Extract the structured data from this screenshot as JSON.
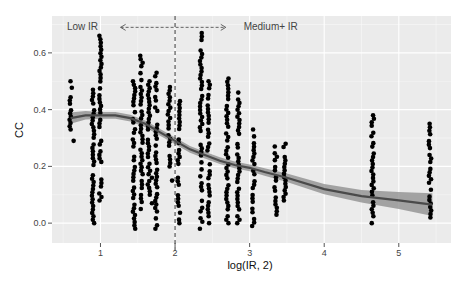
{
  "chart_data": {
    "type": "scatter",
    "title": "",
    "xlabel": "log(IR, 2)",
    "ylabel": "CC",
    "xlim": [
      0.35,
      5.7
    ],
    "ylim": [
      -0.07,
      0.73
    ],
    "x_ticks": [
      1,
      2,
      3,
      4,
      5
    ],
    "x_tick_labels": [
      "1",
      "2",
      "3",
      "4",
      "5"
    ],
    "y_ticks": [
      0.0,
      0.2,
      0.4,
      0.6
    ],
    "y_tick_labels": [
      "0.0",
      "0.2",
      "0.4",
      "0.6"
    ],
    "grid": true,
    "legend": "none",
    "vline": {
      "x": 2.0,
      "style": "dashed"
    },
    "annotations": [
      {
        "text": "Low IR",
        "x": 0.55,
        "y": 0.69
      },
      {
        "text": "<-----------|----------->",
        "x": 1.65,
        "y": 0.69
      },
      {
        "text": "Medium+ IR",
        "x": 3.6,
        "y": 0.69
      }
    ],
    "point_columns": [
      {
        "x": 0.6,
        "ymin": 0.33,
        "ymax": 0.5,
        "extra": [
          0.29
        ]
      },
      {
        "x": 0.9,
        "ymin": 0.0,
        "ymax": 0.47,
        "extra": []
      },
      {
        "x": 1.0,
        "ymin": 0.08,
        "ymax": 0.66,
        "extra": []
      },
      {
        "x": 1.45,
        "ymin": -0.02,
        "ymax": 0.5,
        "extra": []
      },
      {
        "x": 1.55,
        "ymin": 0.05,
        "ymax": 0.59,
        "extra": []
      },
      {
        "x": 1.65,
        "ymin": 0.1,
        "ymax": 0.5,
        "extra": [
          0.07,
          0.16
        ]
      },
      {
        "x": 1.75,
        "ymin": -0.02,
        "ymax": 0.53,
        "extra": []
      },
      {
        "x": 1.92,
        "ymin": 0.2,
        "ymax": 0.48,
        "extra": [
          0.15
        ]
      },
      {
        "x": 2.05,
        "ymin": 0.0,
        "ymax": 0.43,
        "extra": []
      },
      {
        "x": 2.35,
        "ymin": -0.02,
        "ymax": 0.67,
        "extra": []
      },
      {
        "x": 2.45,
        "ymin": 0.0,
        "ymax": 0.5,
        "extra": []
      },
      {
        "x": 2.7,
        "ymin": 0.0,
        "ymax": 0.51,
        "extra": []
      },
      {
        "x": 2.85,
        "ymin": 0.0,
        "ymax": 0.46,
        "extra": []
      },
      {
        "x": 3.05,
        "ymin": -0.01,
        "ymax": 0.33,
        "extra": []
      },
      {
        "x": 3.35,
        "ymin": 0.03,
        "ymax": 0.27,
        "extra": []
      },
      {
        "x": 3.47,
        "ymin": 0.08,
        "ymax": 0.28,
        "extra": []
      },
      {
        "x": 4.65,
        "ymin": 0.0,
        "ymax": 0.38,
        "extra": []
      },
      {
        "x": 5.42,
        "ymin": 0.02,
        "ymax": 0.35,
        "extra": []
      }
    ],
    "smooth": {
      "type": "loess",
      "x": [
        0.6,
        0.8,
        1.0,
        1.2,
        1.4,
        1.6,
        1.8,
        2.0,
        2.2,
        2.4,
        2.6,
        2.8,
        3.0,
        3.2,
        3.5,
        4.0,
        4.5,
        5.0,
        5.45
      ],
      "y": [
        0.37,
        0.38,
        0.38,
        0.38,
        0.37,
        0.35,
        0.32,
        0.29,
        0.26,
        0.24,
        0.22,
        0.205,
        0.195,
        0.18,
        0.16,
        0.12,
        0.095,
        0.08,
        0.065
      ],
      "se_width": [
        0.02,
        0.015,
        0.012,
        0.012,
        0.012,
        0.012,
        0.012,
        0.012,
        0.012,
        0.012,
        0.012,
        0.012,
        0.012,
        0.013,
        0.015,
        0.018,
        0.022,
        0.03,
        0.04
      ]
    },
    "colors": {
      "panel_bg": "#ebebeb",
      "grid": "#ffffff",
      "points": "#000000",
      "smooth_line": "#4a4a4a",
      "smooth_band": "#8a8a8a"
    }
  }
}
